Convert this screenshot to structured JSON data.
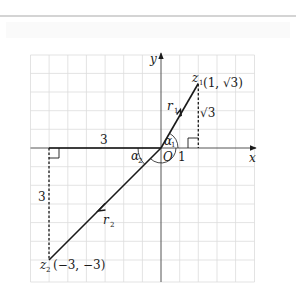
{
  "figure": {
    "axes": {
      "x_label": "x",
      "y_label": "y",
      "origin_label": "O",
      "unit_tick_label": "1"
    },
    "points": {
      "z1": {
        "name": "z",
        "subscript": "1",
        "coords": "(1, √3)",
        "x": 1,
        "y": 1.732
      },
      "z2": {
        "name": "z",
        "subscript": "2",
        "coords": "(−3, −3)",
        "x": -3,
        "y": -3
      }
    },
    "vectors": {
      "r1": {
        "name": "r",
        "subscript": "1"
      },
      "r2": {
        "name": "r",
        "subscript": "2"
      }
    },
    "angles": {
      "a1": {
        "name": "α",
        "subscript": "1"
      },
      "a2": {
        "name": "α",
        "subscript": "2"
      }
    },
    "lengths": {
      "z1_vertical": "√3",
      "z2_horizontal": "3",
      "z2_vertical": "3"
    },
    "grid": {
      "cell_units": 0.5,
      "x_range": [
        -3.5,
        2.5
      ],
      "y_range": [
        -3.5,
        2.5
      ]
    },
    "colors": {
      "ink": "#1a1a1a",
      "grid": "#d9d9d9",
      "axis": "#555555"
    }
  }
}
